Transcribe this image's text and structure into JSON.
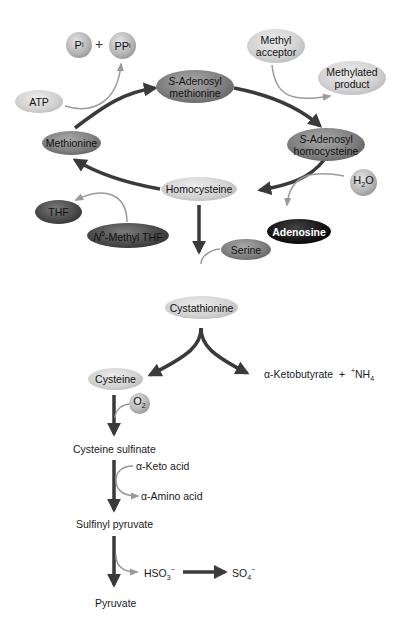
{
  "diagram": {
    "cycle": {
      "sam_line1": "S",
      "sam_line1_rest": "-Adenosyl",
      "sam_line2": "methionine",
      "sah_line1": "S",
      "sah_line1_rest": "-Adenosyl",
      "sah_line2": "homocysteine",
      "homocysteine": "Homocysteine",
      "methionine": "Methionine"
    },
    "side_inputs": {
      "pi": "P",
      "pi_sub": "i",
      "plus": "+",
      "ppi": "PP",
      "ppi_sub": "i",
      "atp": "ATP",
      "methyl_acceptor_line1": "Methyl",
      "methyl_acceptor_line2": "acceptor",
      "methylated_product_line1": "Methylated",
      "methylated_product_line2": "product",
      "h2o_h": "H",
      "h2o_sub": "2",
      "h2o_o": "O",
      "adenosine": "Adenosine",
      "thf": "THF",
      "n5_methyl_thf_n": "N",
      "n5_methyl_thf_sup": "5",
      "n5_methyl_thf_rest": "-Methyl THF",
      "serine": "Serine"
    },
    "transsulfuration": {
      "cystathionine": "Cystathionine",
      "cysteine": "Cysteine",
      "ketobutyrate": "α-Ketobutyrate  +  ",
      "nh4_sup": "+",
      "nh4": "NH",
      "nh4_sub": "4"
    },
    "degradation": {
      "o2": "O",
      "o2_sub": "2",
      "cysteine_sulfinate": "Cysteine sulfinate",
      "keto_acid": "α-Keto acid",
      "amino_acid": "α-Amino acid",
      "sulfinyl_pyruvate": "Sulfinyl pyruvate",
      "hso3": "HSO",
      "hso3_sub": "3",
      "hso3_sup": "−",
      "so4": "SO",
      "so4_sub": "4",
      "so4_sup": "−",
      "pyruvate": "Pyruvate"
    },
    "colors": {
      "main_arrow": "#3a3a3a",
      "side_arrow": "#9a9a9a",
      "background": "#ffffff"
    }
  }
}
